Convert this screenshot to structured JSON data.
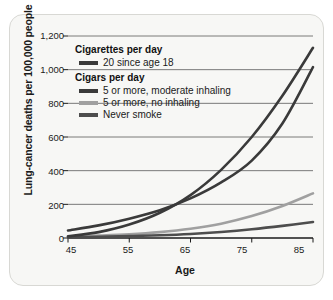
{
  "chart_data": {
    "type": "line",
    "title": "",
    "xlabel": "Age",
    "ylabel": "Lung-cancer deaths per 100,000 people",
    "xlim": [
      45,
      85
    ],
    "ylim": [
      0,
      1200
    ],
    "xticks": [
      "45",
      "55",
      "65",
      "75",
      "85"
    ],
    "yticks": [
      "0",
      "200",
      "400",
      "600",
      "800",
      "1,000",
      "1,200"
    ],
    "grid": "horizontal",
    "legend_position": "upper-left-inside",
    "x": [
      45,
      50,
      55,
      60,
      65,
      70,
      75,
      80,
      85
    ],
    "series": [
      {
        "name": "20 since age 18",
        "group": "Cigarettes per day",
        "color": "#3a3a3a",
        "values": [
          10,
          35,
          80,
          150,
          255,
          405,
          600,
          845,
          1130
        ]
      },
      {
        "name": "5 or more, moderate inhaling",
        "group": "Cigars per day",
        "color": "#3a3a3a",
        "values": [
          45,
          75,
          115,
          165,
          235,
          330,
          460,
          680,
          1015
        ]
      },
      {
        "name": "5 or more, no inhaling",
        "group": "Cigars per day",
        "color": "#a0a0a0",
        "values": [
          8,
          14,
          22,
          35,
          55,
          85,
          130,
          190,
          265
        ]
      },
      {
        "name": "Never smoke",
        "group": "Cigars per day",
        "color": "#4d4d4d",
        "values": [
          4,
          7,
          11,
          16,
          24,
          36,
          52,
          72,
          95
        ]
      }
    ]
  },
  "legend": {
    "heading_cigarettes": "Cigarettes per day",
    "heading_cigars": "Cigars per day",
    "items": [
      {
        "label": "20 since age 18",
        "color": "#3a3a3a"
      },
      {
        "label": "5 or more, moderate inhaling",
        "color": "#3a3a3a"
      },
      {
        "label": "5 or more, no inhaling",
        "color": "#a0a0a0"
      },
      {
        "label": "Never smoke",
        "color": "#4d4d4d"
      }
    ]
  },
  "colors": {
    "panel_background": "#f7f7f5",
    "panel_border": "#d8d8d4",
    "axis": "#1a1a1a",
    "gridline": "#6b6b6b"
  }
}
